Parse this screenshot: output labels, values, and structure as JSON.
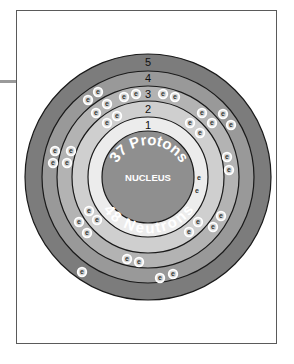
{
  "diagram": {
    "nucleus": {
      "label": "NUCLEUS",
      "protons_text": "37 Protons",
      "neutrons_text": "48 Neutrons",
      "color": "#8f8f8f"
    },
    "shells": [
      {
        "number": "1",
        "label": "1",
        "electron_count": 2,
        "color": "#ececec"
      },
      {
        "number": "2",
        "label": "2",
        "electron_count": 8,
        "color": "#cfcfcf"
      },
      {
        "number": "3",
        "label": "3",
        "electron_count": 18,
        "color": "#b3b3b3"
      },
      {
        "number": "4",
        "label": "4",
        "electron_count": 8,
        "color": "#999999"
      },
      {
        "number": "5",
        "label": "5",
        "electron_count": 1,
        "color": "#7c7c7c"
      }
    ],
    "electron_symbol": "e"
  }
}
